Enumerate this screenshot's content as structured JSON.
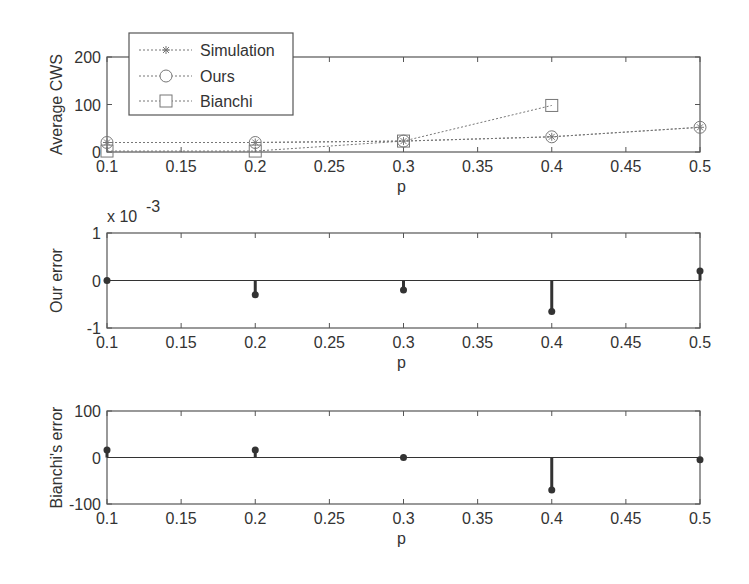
{
  "chart_data": [
    {
      "type": "line",
      "title": "",
      "xlabel": "p",
      "ylabel": "Average CWS",
      "x": [
        0.1,
        0.2,
        0.3,
        0.4,
        0.5
      ],
      "xticks": [
        "0.1",
        "0.15",
        "0.2",
        "0.25",
        "0.3",
        "0.35",
        "0.4",
        "0.45",
        "0.5"
      ],
      "yticks": [
        "0",
        "100",
        "200"
      ],
      "xlim": [
        0.1,
        0.5
      ],
      "ylim": [
        0,
        200
      ],
      "grid": false,
      "legend_position": "upper-left",
      "series": [
        {
          "name": "Simulation",
          "marker": "asterisk",
          "values": [
            20,
            20,
            23,
            32,
            52
          ]
        },
        {
          "name": "Ours",
          "marker": "circle",
          "values": [
            20,
            20,
            23,
            32,
            52
          ]
        },
        {
          "name": "Bianchi",
          "marker": "square",
          "values": [
            2,
            2,
            23,
            98,
            null
          ]
        }
      ]
    },
    {
      "type": "stem",
      "title": "",
      "xlabel": "p",
      "ylabel": "Our error",
      "y_multiplier": "x 10^-3",
      "x": [
        0.1,
        0.2,
        0.3,
        0.4,
        0.5
      ],
      "xticks": [
        "0.1",
        "0.15",
        "0.2",
        "0.25",
        "0.3",
        "0.35",
        "0.4",
        "0.45",
        "0.5"
      ],
      "yticks": [
        "-1",
        "0",
        "1"
      ],
      "xlim": [
        0.1,
        0.5
      ],
      "ylim": [
        -1,
        1
      ],
      "grid": false,
      "series": [
        {
          "name": "Our error",
          "values": [
            0.0,
            -0.3,
            -0.2,
            -0.65,
            0.2
          ]
        }
      ]
    },
    {
      "type": "stem",
      "title": "",
      "xlabel": "p",
      "ylabel": "Bianchi's error",
      "x": [
        0.1,
        0.2,
        0.3,
        0.4,
        0.5
      ],
      "xticks": [
        "0.1",
        "0.15",
        "0.2",
        "0.25",
        "0.3",
        "0.35",
        "0.4",
        "0.45",
        "0.5"
      ],
      "yticks": [
        "-100",
        "0",
        "100"
      ],
      "xlim": [
        0.1,
        0.5
      ],
      "ylim": [
        -100,
        100
      ],
      "grid": false,
      "series": [
        {
          "name": "Bianchi's error",
          "values": [
            16,
            16,
            0,
            -70,
            -5
          ]
        }
      ]
    }
  ],
  "labels": {
    "top_ylabel": "Average CWS",
    "mid_ylabel": "Our error",
    "bot_ylabel": "Bianchi's error",
    "xlabel": "p",
    "mid_multiplier": "x 10",
    "mid_exponent": "-3",
    "legend": [
      "Simulation",
      "Ours",
      "Bianchi"
    ],
    "xticks": [
      "0.1",
      "0.15",
      "0.2",
      "0.25",
      "0.3",
      "0.35",
      "0.4",
      "0.45",
      "0.5"
    ],
    "top_yticks": [
      "0",
      "100",
      "200"
    ],
    "mid_yticks": [
      "-1",
      "0",
      "1"
    ],
    "bot_yticks": [
      "-100",
      "0",
      "100"
    ]
  },
  "colors": {
    "axis": "#555555",
    "line": "#777777",
    "stem": "#333333"
  }
}
